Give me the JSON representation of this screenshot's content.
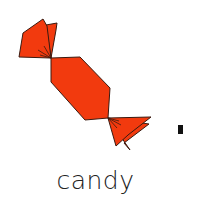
{
  "word": "candy",
  "illustration": {
    "subject": "wrapped-candy-icon",
    "fill_color": "#F23A0E",
    "outline_color": "#3a1a10"
  },
  "punctuation": "."
}
